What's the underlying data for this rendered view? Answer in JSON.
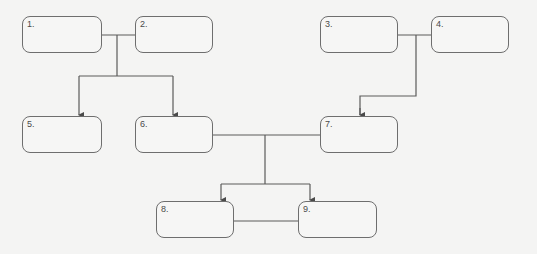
{
  "diagram": {
    "type": "family-tree",
    "nodes": [
      {
        "id": 1,
        "label": "1.",
        "x": 22,
        "y": 16,
        "w": 80,
        "h": 37
      },
      {
        "id": 2,
        "label": "2.",
        "x": 135,
        "y": 16,
        "w": 78,
        "h": 37
      },
      {
        "id": 3,
        "label": "3.",
        "x": 320,
        "y": 16,
        "w": 78,
        "h": 37
      },
      {
        "id": 4,
        "label": "4.",
        "x": 431,
        "y": 16,
        "w": 78,
        "h": 37
      },
      {
        "id": 5,
        "label": "5.",
        "x": 22,
        "y": 116,
        "w": 80,
        "h": 37
      },
      {
        "id": 6,
        "label": "6.",
        "x": 135,
        "y": 116,
        "w": 78,
        "h": 37
      },
      {
        "id": 7,
        "label": "7.",
        "x": 320,
        "y": 116,
        "w": 78,
        "h": 37
      },
      {
        "id": 8,
        "label": "8.",
        "x": 156,
        "y": 201,
        "w": 78,
        "h": 37
      },
      {
        "id": 9,
        "label": "9.",
        "x": 298,
        "y": 201,
        "w": 79,
        "h": 37
      }
    ],
    "edges": [
      {
        "from": [
          1,
          2
        ],
        "to": 5,
        "type": "arrow"
      },
      {
        "from": [
          1,
          2
        ],
        "to": 6,
        "type": "arrow"
      },
      {
        "from": [
          3,
          4
        ],
        "to": 7,
        "type": "arrow"
      },
      {
        "from": [
          6,
          7
        ],
        "to": 8,
        "type": "arrow"
      },
      {
        "from": [
          6,
          7
        ],
        "to": 9,
        "type": "arrow"
      },
      {
        "from": 8,
        "to": 9,
        "type": "line"
      }
    ],
    "colors": {
      "line": "#5a5a5a",
      "background": "#f4f4f3",
      "box_border": "#6e6e6e"
    }
  }
}
